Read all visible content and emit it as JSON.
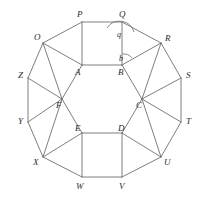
{
  "figure": {
    "name": "regular-dodecagon-with-inner-hexagon",
    "width": 201,
    "height": 199,
    "background_color": "#ffffff",
    "stroke_color": "#6f6f6f",
    "label_color": "#2b2b2b",
    "outer_polygon": {
      "name": "dodecagon-OPQRSTUVWXYZ",
      "sides": 12,
      "vertices": [
        {
          "label": "O",
          "x": 43,
          "y": 43,
          "label_x": 34,
          "label_y": 40
        },
        {
          "label": "P",
          "x": 82,
          "y": 22,
          "label_x": 77,
          "label_y": 17
        },
        {
          "label": "Q",
          "x": 122,
          "y": 22,
          "label_x": 119,
          "label_y": 17
        },
        {
          "label": "R",
          "x": 161,
          "y": 43,
          "label_x": 165,
          "label_y": 41
        },
        {
          "label": "S",
          "x": 181,
          "y": 78,
          "label_x": 186,
          "label_y": 78
        },
        {
          "label": "T",
          "x": 181,
          "y": 122,
          "label_x": 186,
          "label_y": 124
        },
        {
          "label": "U",
          "x": 161,
          "y": 157,
          "label_x": 164,
          "label_y": 165
        },
        {
          "label": "V",
          "x": 122,
          "y": 177,
          "label_x": 119,
          "label_y": 189
        },
        {
          "label": "W",
          "x": 82,
          "y": 177,
          "label_x": 76,
          "label_y": 189
        },
        {
          "label": "X",
          "x": 43,
          "y": 157,
          "label_x": 33,
          "label_y": 165
        },
        {
          "label": "Y",
          "x": 28,
          "y": 122,
          "label_x": 18,
          "label_y": 124
        },
        {
          "label": "Z",
          "x": 28,
          "y": 78,
          "label_x": 18,
          "label_y": 78
        }
      ]
    },
    "inner_polygon": {
      "name": "hexagon-ABCDEF",
      "sides": 6,
      "vertices": [
        {
          "label": "A",
          "x": 82,
          "y": 65,
          "label_x": 75,
          "label_y": 75
        },
        {
          "label": "B",
          "x": 122,
          "y": 65,
          "label_x": 118,
          "label_y": 75
        },
        {
          "label": "C",
          "x": 142,
          "y": 99,
          "label_x": 136,
          "label_y": 108
        },
        {
          "label": "D",
          "x": 122,
          "y": 133,
          "label_x": 118,
          "label_y": 131
        },
        {
          "label": "E",
          "x": 82,
          "y": 133,
          "label_x": 75,
          "label_y": 131
        },
        {
          "label": "F",
          "x": 62,
          "y": 99,
          "label_x": 56,
          "label_y": 108
        }
      ]
    },
    "spokes": [
      {
        "name": "spoke-A-P",
        "from": "A",
        "to": "P"
      },
      {
        "name": "spoke-A-O",
        "from": "A",
        "to": "O"
      },
      {
        "name": "spoke-B-Q",
        "from": "B",
        "to": "Q"
      },
      {
        "name": "spoke-B-R",
        "from": "B",
        "to": "R"
      },
      {
        "name": "spoke-C-R",
        "from": "C",
        "to": "R"
      },
      {
        "name": "spoke-C-S",
        "from": "C",
        "to": "S"
      },
      {
        "name": "spoke-C-T",
        "from": "C",
        "to": "T"
      },
      {
        "name": "spoke-C-U",
        "from": "C",
        "to": "U"
      },
      {
        "name": "spoke-D-U",
        "from": "D",
        "to": "U"
      },
      {
        "name": "spoke-D-V",
        "from": "D",
        "to": "V"
      },
      {
        "name": "spoke-E-W",
        "from": "E",
        "to": "W"
      },
      {
        "name": "spoke-E-X",
        "from": "E",
        "to": "X"
      },
      {
        "name": "spoke-F-X",
        "from": "F",
        "to": "X"
      },
      {
        "name": "spoke-F-Y",
        "from": "F",
        "to": "Y"
      },
      {
        "name": "spoke-F-Z",
        "from": "F",
        "to": "Z"
      },
      {
        "name": "spoke-F-O",
        "from": "F",
        "to": "O"
      }
    ],
    "angle_markers": [
      {
        "name": "angle-q-at-Q",
        "label": "q",
        "vertex": "Q",
        "label_x": 119,
        "label_y": 37,
        "arc_radius": 15,
        "arc_start_x": 107,
        "arc_start_y": 28,
        "arc_end_x": 134,
        "arc_end_y": 32
      },
      {
        "name": "angle-b-at-B",
        "label": "b",
        "vertex": "B",
        "label_x": 121,
        "label_y": 61,
        "arc_radius": 11,
        "arc_start_x": 122,
        "arc_start_y": 54,
        "arc_end_x": 132,
        "arc_end_y": 58
      }
    ]
  }
}
